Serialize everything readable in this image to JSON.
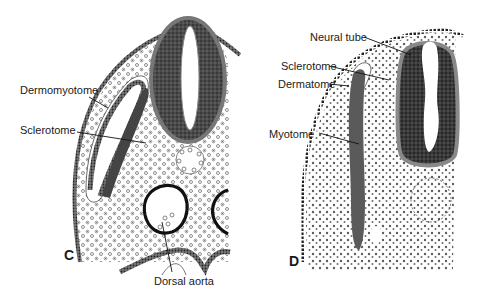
{
  "panels": [
    {
      "id": "C",
      "panel_label": "C",
      "labels": {
        "dermomyotome": "Dermomyotome",
        "sclerotome": "Sclerotome",
        "dorsal_aorta": "Dorsal aorta"
      }
    },
    {
      "id": "D",
      "panel_label": "D",
      "labels": {
        "neural_tube": "Neural tube",
        "sclerotome": "Sclerotome",
        "dermatome": "Dermatome",
        "myotome": "Myotome"
      }
    }
  ],
  "colors": {
    "ink": "#1a1a1a",
    "dark_tissue": "#3a3a3a",
    "mid_tissue": "#5a5a5a",
    "background": "#ffffff"
  }
}
